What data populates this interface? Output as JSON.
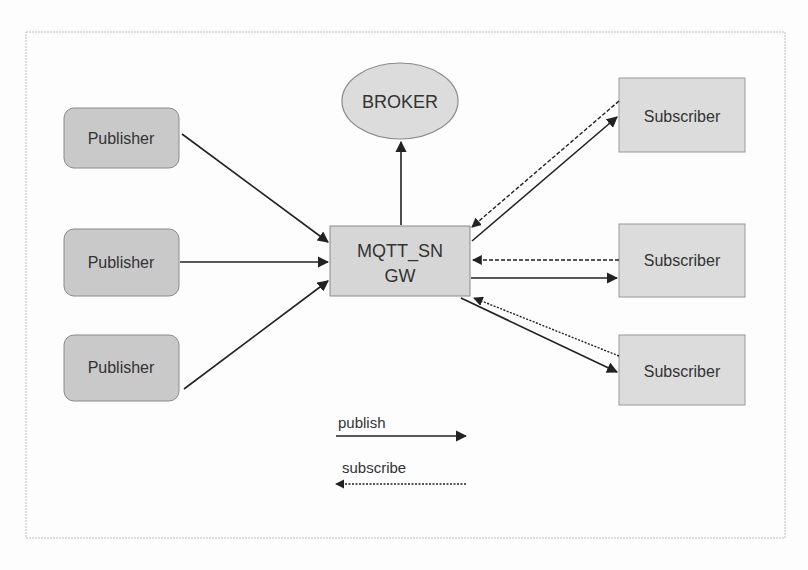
{
  "diagram": {
    "broker": {
      "label": "BROKER"
    },
    "gateway": {
      "line1": "MQTT_SN",
      "line2": "GW"
    },
    "publishers": [
      {
        "label": "Publisher"
      },
      {
        "label": "Publisher"
      },
      {
        "label": "Publisher"
      }
    ],
    "subscribers": [
      {
        "label": "Subscriber"
      },
      {
        "label": "Subscriber"
      },
      {
        "label": "Subscriber"
      }
    ],
    "legend": {
      "publish": {
        "label": "publish",
        "style": "solid"
      },
      "subscribe": {
        "label": "subscribe",
        "style": "dashed"
      }
    },
    "colors": {
      "publisher_fill": "#c9c9c9",
      "node_fill": "#dcdcdc",
      "stroke": "#8a8a8a",
      "arrow": "#222222",
      "text": "#333333"
    }
  }
}
